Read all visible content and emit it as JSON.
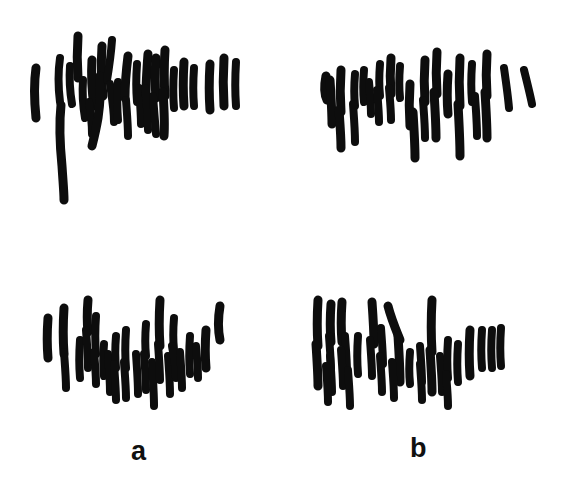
{
  "figure": {
    "kind": "chromosome-spread-micrograph",
    "background_color": "#ffffff",
    "ink_color": "#0d0d0d",
    "width": 573,
    "height": 492,
    "panel_labels": {
      "a": "a",
      "b": "b"
    }
  },
  "chart_data": {
    "type": "scatter",
    "title": "",
    "subtitle": "",
    "xlabel": "",
    "ylabel": "",
    "grid": false,
    "legend_position": "none",
    "annotations": [
      "a",
      "b"
    ],
    "panels": [
      {
        "id": "top-left",
        "column_label": "a",
        "row": "top",
        "origin_x": 0,
        "origin_y": 0,
        "chromosome_count": 29,
        "bbox": [
          28,
          35,
          240,
          195
        ]
      },
      {
        "id": "top-right",
        "column_label": "b",
        "row": "top",
        "origin_x": 287,
        "origin_y": 0,
        "chromosome_count": 27,
        "bbox": [
          318,
          42,
          540,
          175
        ]
      },
      {
        "id": "bottom-left",
        "column_label": "a",
        "row": "bottom",
        "origin_x": 0,
        "origin_y": 270,
        "chromosome_count": 28,
        "bbox": [
          40,
          292,
          230,
          425
        ]
      },
      {
        "id": "bottom-right",
        "column_label": "b",
        "row": "bottom",
        "origin_x": 287,
        "origin_y": 270,
        "chromosome_count": 31,
        "bbox": [
          305,
          295,
          500,
          430
        ]
      }
    ],
    "panel_strokes": {
      "top-left": [
        {
          "d": "M 36 68 C 34 82, 34 98, 36 118",
          "w": 9
        },
        {
          "d": "M 60 58 C 58 72, 58 86, 60 102",
          "w": 8
        },
        {
          "d": "M 61 105 C 59 124, 60 146, 62 166 C 63 182, 64 192, 64 200",
          "w": 9
        },
        {
          "d": "M 78 36 C 77 50, 77 64, 78 78",
          "w": 9
        },
        {
          "d": "M 70 66 C 69 80, 70 92, 72 104",
          "w": 8
        },
        {
          "d": "M 83 80 C 82 94, 83 106, 85 118",
          "w": 8
        },
        {
          "d": "M 92 60 C 91 76, 92 92, 94 106",
          "w": 9
        },
        {
          "d": "M 89 102 C 91 114, 92 124, 92 134",
          "w": 8
        },
        {
          "d": "M 102 46 C 101 62, 101 78, 103 96",
          "w": 9
        },
        {
          "d": "M 100 76 C 101 90, 100 104, 98 118 C 96 130, 94 138, 92 146",
          "w": 9
        },
        {
          "d": "M 112 40 C 111 54, 109 68, 107 80",
          "w": 8
        },
        {
          "d": "M 110 84 C 112 98, 114 110, 114 122",
          "w": 8
        },
        {
          "d": "M 118 82 C 117 96, 117 108, 118 120",
          "w": 8
        },
        {
          "d": "M 128 56 C 126 72, 125 86, 125 98",
          "w": 9
        },
        {
          "d": "M 126 100 C 127 114, 128 126, 128 136",
          "w": 8
        },
        {
          "d": "M 137 64 C 136 78, 136 90, 137 102",
          "w": 8
        },
        {
          "d": "M 139 88 C 140 102, 141 114, 141 124",
          "w": 8
        },
        {
          "d": "M 148 54 C 147 68, 146 82, 146 94",
          "w": 9
        },
        {
          "d": "M 145 88 C 147 104, 148 118, 148 130",
          "w": 8
        },
        {
          "d": "M 156 58 C 155 72, 155 86, 156 98",
          "w": 9
        },
        {
          "d": "M 153 96 C 154 110, 155 122, 156 134",
          "w": 8
        },
        {
          "d": "M 165 50 C 164 66, 164 82, 165 96",
          "w": 9
        },
        {
          "d": "M 163 92 C 164 108, 165 122, 164 136",
          "w": 9
        },
        {
          "d": "M 174 70 C 173 84, 173 96, 174 108",
          "w": 8
        },
        {
          "d": "M 184 62 C 183 78, 183 92, 184 106",
          "w": 9
        },
        {
          "d": "M 194 68 C 193 82, 193 94, 194 106",
          "w": 8
        },
        {
          "d": "M 210 64 C 209 80, 209 96, 210 110",
          "w": 9
        },
        {
          "d": "M 224 58 C 223 74, 223 90, 224 106",
          "w": 9
        },
        {
          "d": "M 236 62 C 235 78, 235 92, 236 106",
          "w": 8
        }
      ],
      "top-right": [
        {
          "d": "M 326 76 C 324 86, 324 94, 327 100",
          "w": 9
        },
        {
          "d": "M 330 80 C 331 96, 332 112, 332 124",
          "w": 9
        },
        {
          "d": "M 341 70 C 340 84, 340 98, 341 112",
          "w": 9
        },
        {
          "d": "M 339 110 C 340 124, 341 136, 341 148",
          "w": 9
        },
        {
          "d": "M 355 74 C 354 86, 354 96, 355 106",
          "w": 8
        },
        {
          "d": "M 353 104 C 354 118, 355 130, 355 142",
          "w": 8
        },
        {
          "d": "M 364 70 C 363 82, 363 92, 364 102",
          "w": 8
        },
        {
          "d": "M 369 82 C 370 94, 371 104, 371 114",
          "w": 8
        },
        {
          "d": "M 380 64 C 379 76, 379 86, 380 96",
          "w": 8
        },
        {
          "d": "M 377 90 C 378 102, 379 112, 379 122",
          "w": 8
        },
        {
          "d": "M 391 58 C 390 70, 390 82, 391 94",
          "w": 9
        },
        {
          "d": "M 389 88 C 390 100, 391 110, 391 120",
          "w": 8
        },
        {
          "d": "M 400 66 C 399 78, 399 88, 400 98",
          "w": 8
        },
        {
          "d": "M 410 84 C 409 98, 409 112, 410 126",
          "w": 9
        },
        {
          "d": "M 413 112 C 414 128, 415 144, 415 158",
          "w": 9
        },
        {
          "d": "M 425 60 C 424 74, 424 88, 425 102",
          "w": 9
        },
        {
          "d": "M 423 100 C 424 114, 425 126, 425 138",
          "w": 8
        },
        {
          "d": "M 437 52 C 436 66, 436 80, 437 94",
          "w": 9
        },
        {
          "d": "M 434 92 C 435 108, 436 124, 436 138",
          "w": 9
        },
        {
          "d": "M 448 74 C 447 88, 447 102, 448 114",
          "w": 9
        },
        {
          "d": "M 460 58 C 459 74, 459 90, 460 106",
          "w": 9
        },
        {
          "d": "M 458 104 C 459 122, 460 140, 460 156",
          "w": 9
        },
        {
          "d": "M 472 64 C 471 78, 471 90, 472 102",
          "w": 8
        },
        {
          "d": "M 475 96 C 476 110, 477 124, 477 136",
          "w": 8
        },
        {
          "d": "M 487 54 C 486 68, 486 82, 487 96",
          "w": 9
        },
        {
          "d": "M 485 92 C 486 108, 487 124, 487 138",
          "w": 9
        },
        {
          "d": "M 504 68 C 506 82, 508 96, 509 108",
          "w": 8
        },
        {
          "d": "M 524 70 C 527 82, 530 94, 532 104",
          "w": 8
        }
      ],
      "bottom-left": [
        {
          "d": "M 48 318 C 47 332, 47 346, 48 358",
          "w": 9
        },
        {
          "d": "M 64 308 C 63 324, 63 340, 64 354",
          "w": 9
        },
        {
          "d": "M 64 352 C 65 366, 66 378, 66 388",
          "w": 8
        },
        {
          "d": "M 80 340 C 79 354, 79 366, 80 378",
          "w": 8
        },
        {
          "d": "M 88 300 C 87 312, 87 322, 88 332",
          "w": 9
        },
        {
          "d": "M 86 330 C 87 344, 88 356, 88 368",
          "w": 8
        },
        {
          "d": "M 96 316 C 95 330, 95 342, 96 354",
          "w": 8
        },
        {
          "d": "M 94 352 C 95 364, 96 374, 96 384",
          "w": 8
        },
        {
          "d": "M 104 344 C 103 356, 103 366, 104 376",
          "w": 8
        },
        {
          "d": "M 108 354 C 109 368, 110 380, 110 392",
          "w": 8
        },
        {
          "d": "M 116 336 C 115 348, 115 358, 116 368",
          "w": 8
        },
        {
          "d": "M 114 364 C 115 378, 116 390, 116 400",
          "w": 8
        },
        {
          "d": "M 126 330 C 125 344, 125 356, 126 368",
          "w": 8
        },
        {
          "d": "M 124 362 C 125 376, 126 388, 126 398",
          "w": 8
        },
        {
          "d": "M 136 354 C 137 368, 138 382, 138 394",
          "w": 8
        },
        {
          "d": "M 146 324 C 145 336, 145 346, 146 356",
          "w": 8
        },
        {
          "d": "M 144 354 C 145 368, 146 380, 146 390",
          "w": 8
        },
        {
          "d": "M 152 362 C 153 378, 154 394, 154 406",
          "w": 8
        },
        {
          "d": "M 160 300 C 159 316, 159 332, 160 346",
          "w": 9
        },
        {
          "d": "M 158 344 C 159 358, 160 370, 160 380",
          "w": 8
        },
        {
          "d": "M 168 356 C 169 370, 170 382, 170 394",
          "w": 8
        },
        {
          "d": "M 174 318 C 173 330, 173 340, 174 350",
          "w": 8
        },
        {
          "d": "M 172 346 C 174 358, 176 368, 176 378",
          "w": 8
        },
        {
          "d": "M 180 352 C 181 366, 182 378, 182 388",
          "w": 8
        },
        {
          "d": "M 190 336 C 189 350, 189 362, 190 374",
          "w": 8
        },
        {
          "d": "M 196 346 C 197 358, 198 368, 198 378",
          "w": 8
        },
        {
          "d": "M 206 330 C 205 344, 205 356, 206 368",
          "w": 9
        },
        {
          "d": "M 220 306 C 218 318, 218 330, 220 340",
          "w": 9
        }
      ],
      "bottom-right": [
        {
          "d": "M 318 300 C 317 316, 317 332, 318 346",
          "w": 9
        },
        {
          "d": "M 316 344 C 317 360, 318 374, 318 386",
          "w": 9
        },
        {
          "d": "M 331 304 C 330 318, 330 330, 331 342",
          "w": 9
        },
        {
          "d": "M 329 336 C 330 350, 331 362, 331 372",
          "w": 8
        },
        {
          "d": "M 342 302 C 341 316, 341 330, 342 342",
          "w": 9
        },
        {
          "d": "M 345 336 C 346 350, 347 362, 347 372",
          "w": 8
        },
        {
          "d": "M 330 356 C 331 370, 332 382, 332 392",
          "w": 8
        },
        {
          "d": "M 341 350 C 342 364, 343 376, 343 386",
          "w": 8
        },
        {
          "d": "M 326 366 C 327 380, 328 392, 328 402",
          "w": 8
        },
        {
          "d": "M 348 370 C 349 384, 350 396, 350 406",
          "w": 8
        },
        {
          "d": "M 358 336 C 357 350, 357 362, 358 374",
          "w": 8
        },
        {
          "d": "M 372 302 C 373 316, 374 330, 374 344",
          "w": 9
        },
        {
          "d": "M 370 340 C 371 354, 372 366, 372 376",
          "w": 8
        },
        {
          "d": "M 381 328 C 382 342, 383 354, 383 364",
          "w": 8
        },
        {
          "d": "M 388 306 C 391 318, 396 330, 400 340",
          "w": 9
        },
        {
          "d": "M 398 336 C 399 352, 400 368, 400 382",
          "w": 9
        },
        {
          "d": "M 380 356 C 381 370, 382 382, 382 392",
          "w": 8
        },
        {
          "d": "M 392 362 C 393 376, 394 388, 394 398",
          "w": 8
        },
        {
          "d": "M 410 352 C 409 364, 409 374, 410 384",
          "w": 8
        },
        {
          "d": "M 420 346 C 421 360, 422 372, 422 382",
          "w": 8
        },
        {
          "d": "M 432 300 C 431 318, 431 336, 432 352",
          "w": 9
        },
        {
          "d": "M 430 350 C 431 366, 432 380, 432 392",
          "w": 9
        },
        {
          "d": "M 420 364 C 421 378, 422 390, 422 400",
          "w": 8
        },
        {
          "d": "M 440 356 C 441 370, 442 382, 442 392",
          "w": 8
        },
        {
          "d": "M 448 340 C 447 354, 447 366, 448 378",
          "w": 8
        },
        {
          "d": "M 446 374 C 447 386, 448 396, 448 406",
          "w": 8
        },
        {
          "d": "M 458 344 C 457 358, 457 370, 458 382",
          "w": 8
        },
        {
          "d": "M 470 330 C 469 346, 469 362, 470 376",
          "w": 9
        },
        {
          "d": "M 482 330 C 481 344, 481 356, 482 368",
          "w": 8
        },
        {
          "d": "M 492 330 C 491 344, 491 356, 492 368",
          "w": 8
        },
        {
          "d": "M 501 328 C 500 342, 500 354, 501 366",
          "w": 8
        }
      ]
    }
  }
}
